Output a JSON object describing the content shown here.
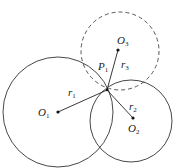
{
  "diagram": {
    "stroke_color": "#333333",
    "circles": [
      {
        "id": "circle-1",
        "center": "O1",
        "cx": 58,
        "cy": 112,
        "r": 55,
        "style": "solid"
      },
      {
        "id": "circle-2",
        "center": "O2",
        "cx": 131,
        "cy": 121,
        "r": 41,
        "style": "solid"
      },
      {
        "id": "circle-3",
        "center": "O3",
        "cx": 120,
        "cy": 51,
        "r": 39,
        "style": "dashed"
      }
    ],
    "points": {
      "O1": {
        "x": 58,
        "y": 112,
        "label": "O",
        "sub": "1"
      },
      "O2": {
        "x": 133,
        "y": 118,
        "label": "O",
        "sub": "2"
      },
      "O3": {
        "x": 118,
        "y": 50,
        "label": "O",
        "sub": "3"
      },
      "P1": {
        "x": 107,
        "y": 90,
        "label": "P",
        "sub": "1"
      }
    },
    "segments": [
      {
        "from": "O1",
        "to": "P1",
        "label": "r",
        "sub": "1"
      },
      {
        "from": "P1",
        "to": "O2",
        "label": "r",
        "sub": "2"
      },
      {
        "from": "P1",
        "to": "O3",
        "label": "r",
        "sub": "3"
      }
    ]
  }
}
